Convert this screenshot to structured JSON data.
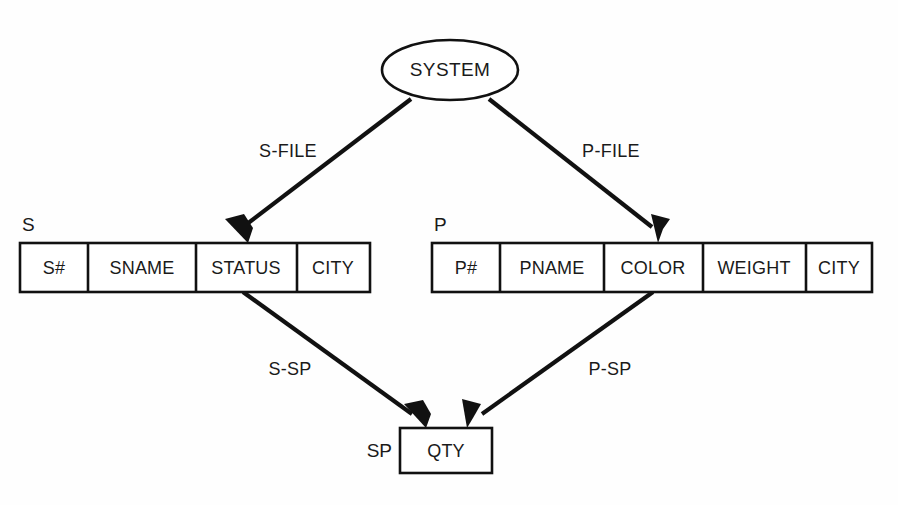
{
  "diagram": {
    "title_node": {
      "label": "SYSTEM",
      "shape": "ellipse"
    },
    "records": [
      {
        "name": "S",
        "label": "S",
        "fields": [
          "S#",
          "SNAME",
          "STATUS",
          "CITY"
        ]
      },
      {
        "name": "P",
        "label": "P",
        "fields": [
          "P#",
          "PNAME",
          "COLOR",
          "WEIGHT",
          "CITY"
        ]
      },
      {
        "name": "SP",
        "label": "SP",
        "fields": [
          "QTY"
        ]
      }
    ],
    "links": [
      {
        "label": "S-FILE",
        "from": "SYSTEM",
        "to": "S"
      },
      {
        "label": "P-FILE",
        "from": "SYSTEM",
        "to": "P"
      },
      {
        "label": "S-SP",
        "from": "S",
        "to": "SP"
      },
      {
        "label": "P-SP",
        "from": "P",
        "to": "SP"
      }
    ],
    "colors": {
      "background": "#fefefe",
      "stroke": "#111111",
      "text": "#1a1a1a",
      "fill": "#ffffff"
    }
  }
}
